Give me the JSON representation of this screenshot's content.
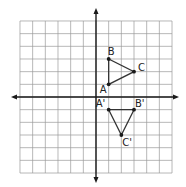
{
  "diagram": {
    "type": "coordinate-grid-transformation",
    "grid": {
      "x_min": -6,
      "x_max": 6,
      "y_min": -6,
      "y_max": 6,
      "unit_px": 12.67,
      "origin_px": [
        96,
        97
      ],
      "line_color": "#9a9a9a",
      "axis_color": "#1a1a1a"
    },
    "triangle_original": {
      "color": "#333333",
      "points": [
        {
          "label": "A",
          "x": 1,
          "y": 1
        },
        {
          "label": "B",
          "x": 1,
          "y": 3
        },
        {
          "label": "C",
          "x": 3,
          "y": 2
        }
      ]
    },
    "triangle_image": {
      "color": "#333333",
      "points": [
        {
          "label": "A'",
          "x": 1,
          "y": -1
        },
        {
          "label": "B'",
          "x": 3,
          "y": -1
        },
        {
          "label": "C'",
          "x": 2,
          "y": -3
        }
      ]
    }
  }
}
